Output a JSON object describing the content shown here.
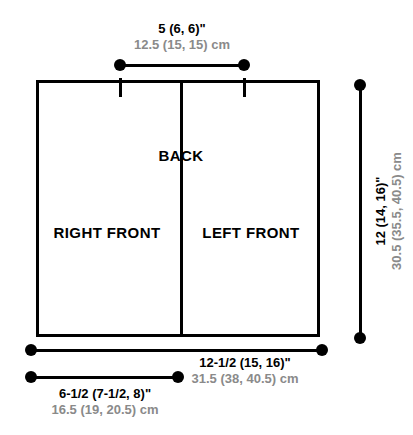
{
  "diagram": {
    "type": "garment-schematic",
    "panels": [
      {
        "id": "right-front",
        "label": "RIGHT FRONT"
      },
      {
        "id": "back",
        "label": "BACK"
      },
      {
        "id": "left-front",
        "label": "LEFT FRONT"
      }
    ],
    "dimensions": {
      "shoulder": {
        "id": "shoulder-width",
        "inches": "5 (6, 6)\"",
        "cm": "12.5 (15, 15) cm"
      },
      "total_width": {
        "id": "total-width",
        "inches": "12-1/2 (15, 16)\"",
        "cm": "31.5 (38, 40.5) cm"
      },
      "front_width": {
        "id": "front-width",
        "inches": "6-1/2 (7-1/2, 8)\"",
        "cm": "16.5 (19, 20.5) cm"
      },
      "length": {
        "id": "body-length",
        "inches": "12 (14, 16)\"",
        "cm": "30.5 (35.5, 40.5) cm"
      }
    },
    "colors": {
      "line": "#000000",
      "inch_text": "#000000",
      "cm_text": "#8a8a8a",
      "background": "#ffffff"
    }
  }
}
